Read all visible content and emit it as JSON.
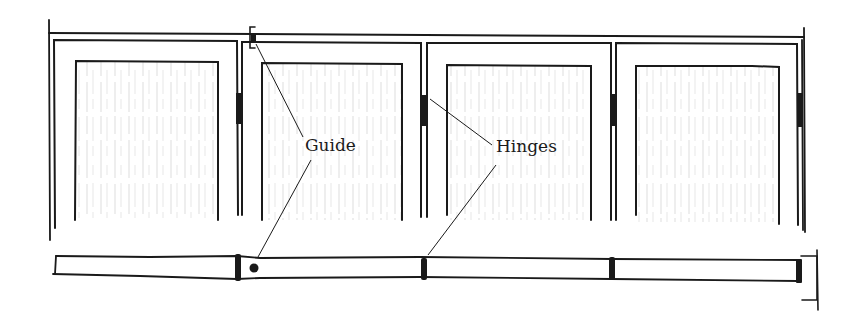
{
  "diagram": {
    "colors": {
      "ink": "#1a1a1a",
      "grain": "#b8b8b8",
      "background": "#ffffff"
    },
    "labels": {
      "guide": "Guide",
      "hinges": "Hinges"
    },
    "elevation": {
      "panel_count": 4,
      "panels": [
        {
          "outer_x": [
            53,
            237
          ],
          "inner_x": [
            76,
            218
          ]
        },
        {
          "outer_x": [
            242,
            421
          ],
          "inner_x": [
            262,
            402
          ]
        },
        {
          "outer_x": [
            427,
            611
          ],
          "inner_x": [
            447,
            591
          ]
        },
        {
          "outer_x": [
            616,
            800
          ],
          "inner_x": [
            636,
            779
          ]
        }
      ],
      "hinge_positions_x": [
        239,
        424,
        613,
        800
      ],
      "guide_position_x": 254
    },
    "plan": {
      "segment_count": 4,
      "hinge_positions_x": [
        238,
        424,
        612,
        799
      ],
      "guide_dot_x": 254
    }
  }
}
